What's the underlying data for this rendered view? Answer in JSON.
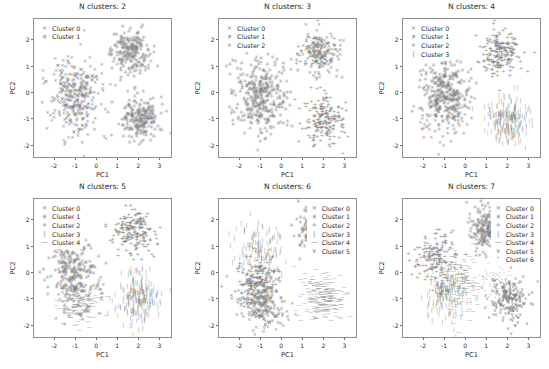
{
  "figure": {
    "background": "#ffffff",
    "point_color": "#808080",
    "axis_color": "#8d8d8d",
    "text_color": "#2b2b2b",
    "rows": 2,
    "cols": 3
  },
  "axis": {
    "xlabel": "PC1",
    "ylabel": "PC2",
    "xticks": [
      "-2",
      "-1",
      "0",
      "1",
      "2",
      "3"
    ],
    "xtick_values": [
      -2,
      -1,
      0,
      1,
      2,
      3
    ],
    "yticks": [
      "-2",
      "-1",
      "0",
      "1",
      "2"
    ],
    "ytick_values": [
      -2,
      -1,
      0,
      1,
      2
    ],
    "xlim": [
      -3.0,
      3.6
    ],
    "ylim": [
      -2.5,
      2.8
    ]
  },
  "markers": {
    "cluster0": "×",
    "cluster1": "✳",
    "cluster2": "+",
    "cluster3": "|",
    "cluster4": "—",
    "cluster5": "∨",
    "cluster6": "˄"
  },
  "chart_data": {
    "type": "scatter",
    "xlabel": "PC1",
    "ylabel": "PC2",
    "xlim": [
      -3.0,
      3.6
    ],
    "ylim": [
      -2.5,
      2.8
    ],
    "grid": false,
    "panels": [
      {
        "id": "panel-1",
        "title": "N clusters: 2",
        "n_clusters": 2,
        "legend_position": "upper left",
        "legend": [
          "Cluster 0",
          "Cluster 1"
        ],
        "series": [
          {
            "name": "Cluster 0",
            "marker": "×",
            "n_points": 330,
            "blobs": [
              {
                "cx": -1.0,
                "cy": -0.1,
                "sx": 0.62,
                "sy": 0.72,
                "n": 330
              }
            ]
          },
          {
            "name": "Cluster 1",
            "marker": "✳",
            "n_points": 420,
            "blobs": [
              {
                "cx": 1.6,
                "cy": 1.5,
                "sx": 0.45,
                "sy": 0.4,
                "n": 210
              },
              {
                "cx": 2.0,
                "cy": -1.0,
                "sx": 0.45,
                "sy": 0.4,
                "n": 210
              }
            ]
          }
        ]
      },
      {
        "id": "panel-2",
        "title": "N clusters: 3",
        "n_clusters": 3,
        "legend_position": "upper left",
        "legend": [
          "Cluster 0",
          "Cluster 1",
          "Cluster 2"
        ],
        "series": [
          {
            "name": "Cluster 0",
            "marker": "×",
            "n_points": 150,
            "blobs": [
              {
                "cx": 1.7,
                "cy": 1.5,
                "sx": 0.46,
                "sy": 0.4,
                "n": 150
              }
            ]
          },
          {
            "name": "Cluster 1",
            "marker": "✳",
            "n_points": 340,
            "blobs": [
              {
                "cx": -1.05,
                "cy": -0.15,
                "sx": 0.62,
                "sy": 0.72,
                "n": 340
              }
            ]
          },
          {
            "name": "Cluster 2",
            "marker": "+",
            "n_points": 240,
            "blobs": [
              {
                "cx": 1.95,
                "cy": -1.0,
                "sx": 0.47,
                "sy": 0.42,
                "n": 190
              },
              {
                "cx": 1.5,
                "cy": 1.6,
                "sx": 0.4,
                "sy": 0.36,
                "n": 50
              }
            ]
          }
        ]
      },
      {
        "id": "panel-3",
        "title": "N clusters: 4",
        "n_clusters": 4,
        "legend_position": "upper left",
        "legend": [
          "Cluster 0",
          "Cluster 1",
          "Cluster 2",
          "Cluster 3"
        ],
        "series": [
          {
            "name": "Cluster 0",
            "marker": "×",
            "n_points": 140,
            "blobs": [
              {
                "cx": -1.1,
                "cy": -0.5,
                "sx": 0.6,
                "sy": 0.68,
                "n": 140
              }
            ]
          },
          {
            "name": "Cluster 1",
            "marker": "✳",
            "n_points": 230,
            "blobs": [
              {
                "cx": -1.0,
                "cy": 0.1,
                "sx": 0.58,
                "sy": 0.62,
                "n": 230
              }
            ]
          },
          {
            "name": "Cluster 2",
            "marker": "+",
            "n_points": 200,
            "blobs": [
              {
                "cx": 1.65,
                "cy": 1.5,
                "sx": 0.47,
                "sy": 0.42,
                "n": 200
              }
            ]
          },
          {
            "name": "Cluster 3",
            "marker": "|",
            "n_points": 215,
            "blobs": [
              {
                "cx": 1.95,
                "cy": -1.0,
                "sx": 0.48,
                "sy": 0.44,
                "n": 215
              }
            ]
          }
        ]
      },
      {
        "id": "panel-4",
        "title": "N clusters: 5",
        "n_clusters": 5,
        "legend_position": "upper left",
        "legend": [
          "Cluster 0",
          "Cluster 1",
          "Cluster 2",
          "Cluster 3",
          "Cluster 4"
        ],
        "series": [
          {
            "name": "Cluster 0",
            "marker": "×",
            "n_points": 110,
            "blobs": [
              {
                "cx": -0.85,
                "cy": -0.75,
                "sx": 0.52,
                "sy": 0.5,
                "n": 110
              }
            ]
          },
          {
            "name": "Cluster 1",
            "marker": "✳",
            "n_points": 200,
            "blobs": [
              {
                "cx": -1.15,
                "cy": 0.15,
                "sx": 0.55,
                "sy": 0.58,
                "n": 200
              }
            ]
          },
          {
            "name": "Cluster 2",
            "marker": "+",
            "n_points": 190,
            "blobs": [
              {
                "cx": 1.7,
                "cy": 1.55,
                "sx": 0.48,
                "sy": 0.44,
                "n": 190
              }
            ]
          },
          {
            "name": "Cluster 3",
            "marker": "|",
            "n_points": 215,
            "blobs": [
              {
                "cx": 1.95,
                "cy": -0.95,
                "sx": 0.5,
                "sy": 0.46,
                "n": 215
              }
            ]
          },
          {
            "name": "Cluster 4",
            "marker": "—",
            "n_points": 90,
            "blobs": [
              {
                "cx": -0.95,
                "cy": -1.25,
                "sx": 0.55,
                "sy": 0.4,
                "n": 90
              }
            ]
          }
        ]
      },
      {
        "id": "panel-5",
        "title": "N clusters: 6",
        "n_clusters": 6,
        "legend_position": "upper right",
        "legend": [
          "Cluster 0",
          "Cluster 1",
          "Cluster 2",
          "Cluster 3",
          "Cluster 4",
          "Cluster 5"
        ],
        "series": [
          {
            "name": "Cluster 0",
            "marker": "×",
            "n_points": 150,
            "blobs": [
              {
                "cx": -1.05,
                "cy": -0.85,
                "sx": 0.55,
                "sy": 0.5,
                "n": 150
              }
            ]
          },
          {
            "name": "Cluster 1",
            "marker": "✳",
            "n_points": 175,
            "blobs": [
              {
                "cx": 1.55,
                "cy": 1.6,
                "sx": 0.45,
                "sy": 0.42,
                "n": 175
              }
            ]
          },
          {
            "name": "Cluster 2",
            "marker": "+",
            "n_points": 170,
            "blobs": [
              {
                "cx": -1.1,
                "cy": -0.35,
                "sx": 0.52,
                "sy": 0.52,
                "n": 170
              }
            ]
          },
          {
            "name": "Cluster 3",
            "marker": "|",
            "n_points": 120,
            "blobs": [
              {
                "cx": -1.15,
                "cy": 0.95,
                "sx": 0.58,
                "sy": 0.45,
                "n": 120
              }
            ]
          },
          {
            "name": "Cluster 4",
            "marker": "—",
            "n_points": 215,
            "blobs": [
              {
                "cx": 1.95,
                "cy": -0.9,
                "sx": 0.52,
                "sy": 0.45,
                "n": 215
              }
            ]
          },
          {
            "name": "Cluster 5",
            "marker": "∨",
            "n_points": 95,
            "blobs": [
              {
                "cx": -0.85,
                "cy": -1.45,
                "sx": 0.5,
                "sy": 0.35,
                "n": 95
              }
            ]
          }
        ]
      },
      {
        "id": "panel-6",
        "title": "N clusters: 7",
        "n_clusters": 7,
        "legend_position": "upper right",
        "legend": [
          "Cluster 0",
          "Cluster 1",
          "Cluster 2",
          "Cluster 3",
          "Cluster 4",
          "Cluster 5",
          "Cluster 6"
        ],
        "series": [
          {
            "name": "Cluster 0",
            "marker": "×",
            "n_points": 85,
            "blobs": [
              {
                "cx": 0.75,
                "cy": 1.45,
                "sx": 0.35,
                "sy": 0.4,
                "n": 85
              }
            ]
          },
          {
            "name": "Cluster 1",
            "marker": "✳",
            "n_points": 150,
            "blobs": [
              {
                "cx": 1.15,
                "cy": 1.75,
                "sx": 0.35,
                "sy": 0.42,
                "n": 150
              }
            ]
          },
          {
            "name": "Cluster 2",
            "marker": "+",
            "n_points": 165,
            "blobs": [
              {
                "cx": -1.45,
                "cy": 0.55,
                "sx": 0.5,
                "sy": 0.48,
                "n": 165
              }
            ]
          },
          {
            "name": "Cluster 3",
            "marker": "|",
            "n_points": 175,
            "blobs": [
              {
                "cx": -0.95,
                "cy": -0.75,
                "sx": 0.52,
                "sy": 0.5,
                "n": 175
              }
            ]
          },
          {
            "name": "Cluster 4",
            "marker": "—",
            "n_points": 120,
            "blobs": [
              {
                "cx": -0.25,
                "cy": -0.3,
                "sx": 0.4,
                "sy": 0.6,
                "n": 120
              }
            ]
          },
          {
            "name": "Cluster 5",
            "marker": "∨",
            "n_points": 190,
            "blobs": [
              {
                "cx": 2.05,
                "cy": -1.0,
                "sx": 0.48,
                "sy": 0.42,
                "n": 190
              }
            ]
          },
          {
            "name": "Cluster 6",
            "marker": "˄",
            "n_points": 70,
            "blobs": [
              {
                "cx": 1.35,
                "cy": -0.45,
                "sx": 0.35,
                "sy": 0.3,
                "n": 70
              }
            ]
          }
        ]
      }
    ]
  }
}
